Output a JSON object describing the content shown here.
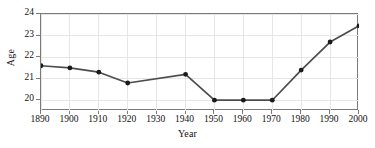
{
  "chart_data": {
    "type": "line",
    "title": "",
    "xlabel": "Year",
    "ylabel": "Age",
    "xlim": [
      1890,
      2000
    ],
    "ylim": [
      19.5,
      24
    ],
    "xticks": [
      1890,
      1900,
      1910,
      1920,
      1930,
      1940,
      1950,
      1960,
      1970,
      1980,
      1990,
      2000
    ],
    "yticks": [
      20,
      21,
      22,
      23,
      24
    ],
    "grid": true,
    "legend": null,
    "series": [
      {
        "name": "Age",
        "x": [
          1890,
          1900,
          1910,
          1920,
          1940,
          1950,
          1960,
          1970,
          1980,
          1990,
          2000
        ],
        "values": [
          21.6,
          21.5,
          21.3,
          20.8,
          21.2,
          20.0,
          20.0,
          20.0,
          21.4,
          22.7,
          23.45
        ],
        "marker": "circle",
        "marker_color": "#1a1a1a",
        "line_color": "#4d4d4d"
      }
    ],
    "note": "No data marker plotted at 1930; line interpolates directly from 1920 to 1940."
  },
  "axis": {
    "x_tick_labels": [
      "1890",
      "1900",
      "1910",
      "1920",
      "1930",
      "1940",
      "1950",
      "1960",
      "1970",
      "1980",
      "1990",
      "2000"
    ],
    "y_tick_labels": [
      "20",
      "21",
      "22",
      "23",
      "24"
    ]
  },
  "colors": {
    "line": "#4d4d4d",
    "marker": "#1a1a1a",
    "grid": "#e6e6e6",
    "frame": "#7a7a7a",
    "background": "#ffffff",
    "text": "#111111"
  }
}
